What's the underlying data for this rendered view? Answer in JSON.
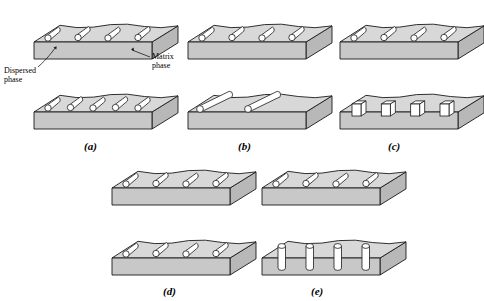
{
  "figure": {
    "type": "composite-materials-schematic",
    "colors": {
      "block_top": "#d8d8d8",
      "block_front": "#c8c8c8",
      "block_side": "#b8b8b8",
      "outline": "#1a1a1a",
      "particle_fill": "#ffffff",
      "background": "#ffffff"
    }
  },
  "annotations": [
    {
      "id": "matrix-phase",
      "text": "Matrix\nphase",
      "x": 152,
      "y": 52
    },
    {
      "id": "dispersed-phase",
      "text": "Dispersed\nphase",
      "x": 4,
      "y": 66
    }
  ],
  "panels": [
    {
      "id": "a",
      "label": "(a)",
      "label_x": 84,
      "label_y": 140,
      "blocks": [
        {
          "row": "top",
          "inclusion_style": "short-rod-with-circles",
          "count": 4
        },
        {
          "row": "bottom",
          "inclusion_style": "short-rod-with-circles",
          "count": 5
        }
      ]
    },
    {
      "id": "b",
      "label": "(b)",
      "label_x": 238,
      "label_y": 140,
      "blocks": [
        {
          "row": "top",
          "inclusion_style": "short-rod-with-circles",
          "count": 4
        },
        {
          "row": "bottom",
          "inclusion_style": "long-rod",
          "count": 2
        }
      ]
    },
    {
      "id": "c",
      "label": "(c)",
      "label_x": 388,
      "label_y": 140,
      "blocks": [
        {
          "row": "top",
          "inclusion_style": "short-rod-with-circles",
          "count": 4
        },
        {
          "row": "bottom",
          "inclusion_style": "rectangular-box",
          "count": 4
        }
      ]
    },
    {
      "id": "d",
      "label": "(d)",
      "label_x": 163,
      "label_y": 285,
      "blocks": [
        {
          "row": "top",
          "inclusion_style": "short-rod-with-circles",
          "count": 4
        },
        {
          "row": "bottom",
          "inclusion_style": "short-rod-with-circles",
          "count": 4
        }
      ]
    },
    {
      "id": "e",
      "label": "(e)",
      "label_x": 311,
      "label_y": 285,
      "blocks": [
        {
          "row": "top",
          "inclusion_style": "short-rod-with-circles",
          "count": 4
        },
        {
          "row": "bottom",
          "inclusion_style": "vertical-cylinder",
          "count": 4
        }
      ]
    }
  ]
}
